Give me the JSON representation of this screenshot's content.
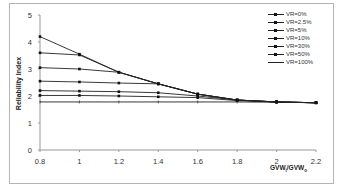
{
  "chart_data": {
    "type": "line",
    "title": "",
    "xlabel": "GVWi/GVWo",
    "ylabel": "Reliability Index",
    "x": [
      0.8,
      1.0,
      1.2,
      1.4,
      1.6,
      1.8,
      2.0,
      2.2
    ],
    "xticks": [
      "0.8",
      "1",
      "1.2",
      "1.4",
      "1.6",
      "1.8",
      "2",
      "2.2"
    ],
    "yticks": [
      "0",
      "1",
      "2",
      "3",
      "4",
      "5"
    ],
    "xlim": [
      0.8,
      2.2
    ],
    "ylim": [
      0,
      5
    ],
    "grid": false,
    "legend_position": "top-right",
    "series": [
      {
        "name": "VR=0%",
        "values": [
          4.2,
          3.55,
          2.88,
          2.45,
          2.07,
          1.85,
          1.78,
          1.75
        ]
      },
      {
        "name": "VR=2.5%",
        "values": [
          3.6,
          3.52,
          2.88,
          2.45,
          2.07,
          1.85,
          1.78,
          1.75
        ]
      },
      {
        "name": "VR=5%",
        "values": [
          3.05,
          3.0,
          2.88,
          2.45,
          2.07,
          1.85,
          1.78,
          1.75
        ]
      },
      {
        "name": "VR=10%",
        "values": [
          2.55,
          2.52,
          2.48,
          2.45,
          2.07,
          1.85,
          1.78,
          1.75
        ]
      },
      {
        "name": "VR=30%",
        "values": [
          2.2,
          2.18,
          2.16,
          2.12,
          2.0,
          1.85,
          1.78,
          1.75
        ]
      },
      {
        "name": "VR=50%",
        "values": [
          2.02,
          2.02,
          2.0,
          1.97,
          1.94,
          1.83,
          1.78,
          1.75
        ]
      },
      {
        "name": "VR=100%",
        "values": [
          1.78,
          1.78,
          1.78,
          1.78,
          1.78,
          1.78,
          1.77,
          1.75
        ]
      }
    ]
  },
  "axes": {
    "xlabel_main": "GVW",
    "xlabel_sub1": "i",
    "xlabel_mid": "/GVW",
    "xlabel_sub2": "o",
    "ylabel": "Reliability Index"
  },
  "legend": [
    {
      "label": "VR=0%"
    },
    {
      "label": "VR=2.5%"
    },
    {
      "label": "VR=5%"
    },
    {
      "label": "VR=10%"
    },
    {
      "label": "VR=30%"
    },
    {
      "label": "VR=50%"
    },
    {
      "label": "VR=100%"
    }
  ],
  "colors": {
    "line": "#222222",
    "axis": "#999999",
    "frame": "#b5b5b5"
  }
}
